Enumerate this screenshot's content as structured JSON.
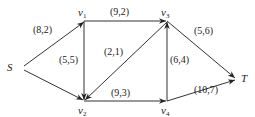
{
  "diagram": {
    "type": "flow-network",
    "nodes": [
      {
        "id": "S",
        "label": "S",
        "x": 20,
        "y": 67
      },
      {
        "id": "v1",
        "label": "v",
        "sub": "1",
        "x": 84,
        "y": 21
      },
      {
        "id": "v3",
        "label": "v",
        "sub": "3",
        "x": 167,
        "y": 21
      },
      {
        "id": "T",
        "label": "T",
        "x": 238,
        "y": 79
      },
      {
        "id": "v2",
        "label": "v",
        "sub": "2",
        "x": 84,
        "y": 101
      },
      {
        "id": "v4",
        "label": "v",
        "sub": "4",
        "x": 167,
        "y": 101
      }
    ],
    "edges": [
      {
        "from": "S",
        "to": "v1",
        "label": "(8,2)"
      },
      {
        "from": "S",
        "to": "v2",
        "label": ""
      },
      {
        "from": "v1",
        "to": "v3",
        "label": "(9,2)"
      },
      {
        "from": "v1",
        "to": "v2",
        "label": "(5,5)"
      },
      {
        "from": "v3",
        "to": "v2",
        "label": "(2,1)"
      },
      {
        "from": "v2",
        "to": "v4",
        "label": "(9,3)"
      },
      {
        "from": "v4",
        "to": "v3",
        "label": "(6,4)"
      },
      {
        "from": "v3",
        "to": "T",
        "label": "(5,6)"
      },
      {
        "from": "v4",
        "to": "T",
        "label": "(10,7)"
      }
    ]
  }
}
